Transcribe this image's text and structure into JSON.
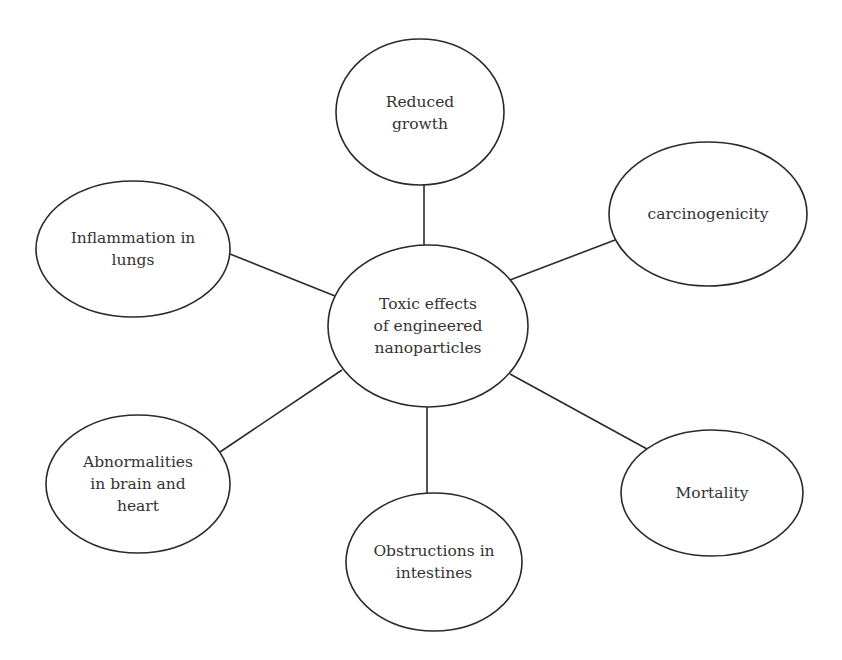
{
  "diagram": {
    "type": "mind-map",
    "center": {
      "id": "toxic-effects",
      "label": "Toxic effects\nof engineered\nnanoparticles"
    },
    "nodes": [
      {
        "id": "reduced-growth",
        "label": "Reduced\ngrowth"
      },
      {
        "id": "carcinogenicity",
        "label": "carcinogenicity"
      },
      {
        "id": "inflammation-in-lungs",
        "label": "Inflammation in\nlungs"
      },
      {
        "id": "abnormalities-brain-heart",
        "label": "Abnormalities\nin brain and\nheart"
      },
      {
        "id": "obstructions-intestines",
        "label": "Obstructions in\nintestines"
      },
      {
        "id": "mortality",
        "label": "Mortality"
      }
    ],
    "edges": [
      {
        "from": "toxic-effects",
        "to": "reduced-growth"
      },
      {
        "from": "toxic-effects",
        "to": "carcinogenicity"
      },
      {
        "from": "toxic-effects",
        "to": "inflammation-in-lungs"
      },
      {
        "from": "toxic-effects",
        "to": "abnormalities-brain-heart"
      },
      {
        "from": "toxic-effects",
        "to": "obstructions-intestines"
      },
      {
        "from": "toxic-effects",
        "to": "mortality"
      }
    ],
    "colors": {
      "stroke": "#2a2a2a",
      "text": "#333333",
      "background": "#ffffff"
    }
  }
}
